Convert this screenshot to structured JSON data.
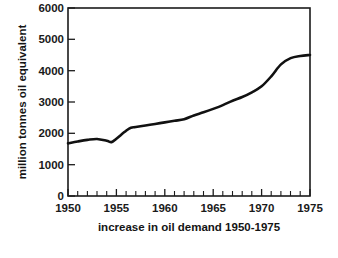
{
  "chart_data": {
    "type": "line",
    "title": "increase in oil demand 1950-1975",
    "xlabel": "increase in oil demand 1950-1975",
    "ylabel": "million tonnes oil equivalent",
    "xlim": [
      1950,
      1975
    ],
    "ylim": [
      0,
      6000
    ],
    "grid": false,
    "legend_position": "none",
    "x_tick_labels": [
      "1950",
      "1955",
      "1960",
      "1965",
      "1970",
      "1975"
    ],
    "x_major_ticks": [
      1950,
      1955,
      1960,
      1965,
      1970,
      1975
    ],
    "x_minor_tick_step": 1,
    "y_tick_labels": [
      "0",
      "1000",
      "2000",
      "3000",
      "4000",
      "5000",
      "6000"
    ],
    "y_major_ticks": [
      0,
      1000,
      2000,
      3000,
      4000,
      5000,
      6000
    ],
    "series": [
      {
        "name": "oil demand",
        "x": [
          1950,
          1951,
          1952,
          1953,
          1954,
          1954.5,
          1955,
          1956,
          1956.5,
          1957,
          1958,
          1959,
          1960,
          1961,
          1962,
          1963,
          1964,
          1965,
          1966,
          1967,
          1968,
          1969,
          1970,
          1971,
          1972,
          1973,
          1974,
          1975
        ],
        "values": [
          1680,
          1740,
          1790,
          1820,
          1760,
          1720,
          1830,
          2080,
          2180,
          2200,
          2250,
          2300,
          2350,
          2400,
          2450,
          2570,
          2670,
          2780,
          2900,
          3040,
          3160,
          3310,
          3500,
          3820,
          4200,
          4400,
          4470,
          4500
        ]
      }
    ]
  },
  "axis_labels": {
    "y_axis_caption": "million tonnes oil equivalent",
    "x_axis_caption": "increase in oil demand 1950-1975"
  },
  "colors": {
    "line": "#111111",
    "frame": "#1b1b1b",
    "text": "#141414",
    "background": "#ffffff"
  }
}
